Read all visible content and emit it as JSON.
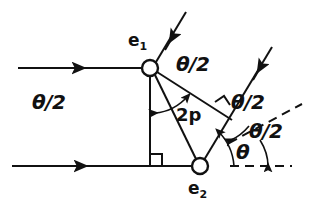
{
  "figure": {
    "type": "physics-ray-diagram",
    "background_color": "#ffffff",
    "stroke_color": "#111111"
  },
  "nodes": [
    {
      "id": "e1",
      "label": "e",
      "subscript": "1",
      "x": 150,
      "y": 68,
      "radius": 8,
      "label_x": 130,
      "label_y": 36
    },
    {
      "id": "e2",
      "label": "e",
      "subscript": "2",
      "x": 200,
      "y": 166,
      "radius": 8,
      "label_x": 190,
      "label_y": 184
    }
  ],
  "labels": {
    "theta_half_top_right": "θ/2",
    "theta_half_left": "θ/2",
    "theta_half_mid_right": "θ/2",
    "theta_half_low_right": "θ/2",
    "theta": "θ",
    "separation": "2p",
    "e1": "e",
    "e1_sub": "1",
    "e2": "e",
    "e2_sub": "2"
  },
  "label_positions": {
    "theta_half_top_right": {
      "x": 176,
      "y": 63
    },
    "theta_half_left": {
      "x": 35,
      "y": 102
    },
    "theta_half_mid_right": {
      "x": 233,
      "y": 100
    },
    "theta_half_low_right": {
      "x": 248,
      "y": 128
    },
    "theta": {
      "x": 238,
      "y": 148
    },
    "separation": {
      "x": 178,
      "y": 112
    }
  },
  "geometry": {
    "incoming_ray_top": {
      "x1": 18,
      "y1": 68,
      "x2": 142,
      "y2": 68,
      "arrow_at": 0.45
    },
    "incoming_ray_bottom": {
      "x1": 12,
      "y1": 166,
      "x2": 192,
      "y2": 166,
      "arrow_at": 0.38
    },
    "vertical_drop": {
      "x1": 150,
      "y1": 76,
      "x2": 150,
      "y2": 166
    },
    "separation_line": {
      "x1": 155,
      "y1": 74,
      "x2": 196,
      "y2": 159
    },
    "outgoing_e1_up": {
      "x1": 156,
      "y1": 62,
      "x2": 186,
      "y2": 12,
      "arrow_at": 0.55
    },
    "outgoing_e1_right": {
      "x1": 157,
      "y1": 71,
      "x2": 230,
      "y2": 118,
      "arrow_at": 0.62
    },
    "outgoing_e2_up": {
      "x1": 204,
      "y1": 159,
      "x2": 272,
      "y2": 47,
      "arrow_at": 0.62
    },
    "right_angle_baseline": {
      "x": 150,
      "y": 166,
      "size": 12
    },
    "right_angle_crossing": {
      "x": 222,
      "y": 107,
      "size": 11
    },
    "dashed_horizontal": {
      "x1": 228,
      "y1": 166,
      "x2": 292,
      "y2": 166
    },
    "dashed_diagonal": {
      "x1": 228,
      "y1": 142,
      "x2": 300,
      "y2": 104
    },
    "arc_e2_theta": {
      "cx": 200,
      "cy": 166,
      "r": 34,
      "start_deg": 0,
      "end_deg": 62
    },
    "arc_e2_theta_half": {
      "cx": 200,
      "cy": 166,
      "r": 52,
      "start_deg": 28,
      "end_deg": 59
    },
    "arc_e1_double": {
      "cx": 150,
      "cy": 68,
      "r": 48,
      "start_deg": -82,
      "end_deg": -32
    }
  },
  "annotations": {
    "arrowhead_style": "solid-filled-triangle",
    "line_weight": 2,
    "dash_pattern": "7 5"
  }
}
